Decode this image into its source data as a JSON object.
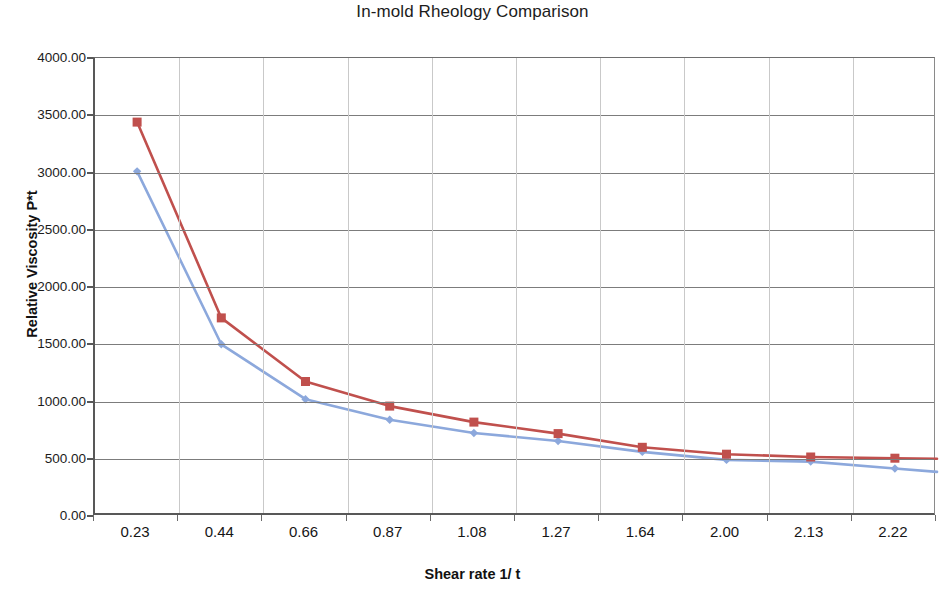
{
  "chart_data": {
    "type": "line",
    "title": "In-mold Rheology Comparison",
    "xlabel": "Shear rate 1/ t",
    "ylabel": "Relative Viscosity P*t",
    "categories": [
      "0.23",
      "0.44",
      "0.66",
      "0.87",
      "1.08",
      "1.27",
      "1.64",
      "2.00",
      "2.13",
      "2.22"
    ],
    "ytick_labels": [
      "4000.00",
      "3500.00",
      "3000.00",
      "2500.00",
      "2000.00",
      "1500.00",
      "1000.00",
      "500.00",
      "0.00"
    ],
    "ytick_values": [
      4000,
      3500,
      3000,
      2500,
      2000,
      1500,
      1000,
      500,
      0
    ],
    "ylim": [
      0,
      4000
    ],
    "grid": "both",
    "legend": "none",
    "series": [
      {
        "name": "series-red",
        "color": "#C0504D",
        "marker": "square",
        "values": [
          3440,
          1730,
          1175,
          960,
          820,
          720,
          600,
          540,
          515,
          505
        ]
      },
      {
        "name": "series-blue",
        "color": "#8CA8DC",
        "marker": "diamond",
        "values": [
          3010,
          1500,
          1020,
          840,
          725,
          655,
          560,
          490,
          475,
          415
        ]
      }
    ]
  }
}
